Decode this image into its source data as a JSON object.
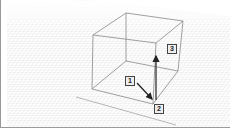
{
  "viewport": {
    "label": "3D modeling viewport"
  },
  "callouts": [
    {
      "id": "1",
      "label": "1"
    },
    {
      "id": "2",
      "label": "2"
    },
    {
      "id": "3",
      "label": "3"
    }
  ],
  "colors": {
    "grid": "#cfcfcf",
    "box": "#888888",
    "arrow": "#222222",
    "sky": "#ffffff"
  }
}
